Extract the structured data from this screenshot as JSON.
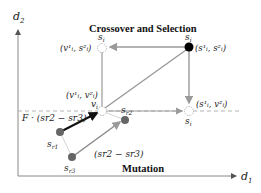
{
  "titles": {
    "crossover": "Crossover and Selection",
    "mutation": "Mutation"
  },
  "axes": {
    "x_label": "d",
    "x_sub": "1",
    "y_label": "d",
    "y_sub": "2"
  },
  "points": {
    "s_i_top": {
      "label": "s",
      "sub": "i",
      "coord": "(s",
      "coord_full": "(s¹ᵢ, s²ᵢ)"
    },
    "crossover_top_left": {
      "name": "s",
      "sub": "i",
      "coord_full": "(v¹ᵢ, s²ᵢ)"
    },
    "v_i": {
      "name": "v",
      "sub": "i",
      "coord_full": "(v¹ᵢ, v²ᵢ)"
    },
    "crossover_bottom_right": {
      "name": "s",
      "sub": "i",
      "coord_full": "(s¹ᵢ, v²ᵢ)"
    },
    "s_r1": {
      "name": "s",
      "sub": "r1"
    },
    "s_r2": {
      "name": "s",
      "sub": "r2"
    },
    "s_r3": {
      "name": "s",
      "sub": "r3"
    }
  },
  "annotations": {
    "scaled_diff": "F · (s",
    "scaled_diff_full": "F · (sr2 − sr3)",
    "diff_full": "(sr2 − sr3)"
  },
  "colors": {
    "axis": "#777777",
    "edge_gray": "#9a9a9a",
    "arrow_black": "#111111",
    "point_gray": "#666666",
    "dotted_circle": "#aaaaaa",
    "filled_point": "#000000"
  }
}
